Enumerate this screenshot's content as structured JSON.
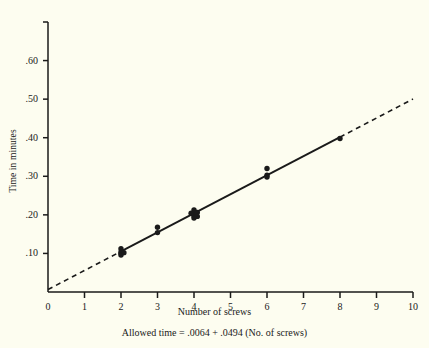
{
  "figure": {
    "background_color": "#fdfdf0",
    "ink_color": "#1a1a1a"
  },
  "axes": {
    "y_title": "Time in minutes",
    "x_title": "Number of screws",
    "y_tick_labels": [
      ".10",
      ".20",
      ".30",
      ".40",
      ".50",
      ".60"
    ],
    "x_tick_labels": [
      "0",
      "1",
      "2",
      "3",
      "4",
      "5",
      "6",
      "7",
      "8",
      "9",
      "10"
    ]
  },
  "caption": {
    "equation": "Allowed time = .0064 + .0494 (No. of screws)"
  },
  "chart_data": {
    "type": "scatter",
    "title": "",
    "subtitle": "",
    "xlabel": "Number of screws",
    "ylabel": "Time in minutes",
    "xlim": [
      0,
      10
    ],
    "ylim": [
      0,
      0.7
    ],
    "grid": false,
    "legend": "none",
    "x_ticks": [
      0,
      1,
      2,
      3,
      4,
      5,
      6,
      7,
      8,
      9,
      10
    ],
    "x_tick_labels": [
      "0",
      "1",
      "2",
      "3",
      "4",
      "5",
      "6",
      "7",
      "8",
      "9",
      "10"
    ],
    "y_ticks": [
      0.1,
      0.2,
      0.3,
      0.4,
      0.5,
      0.6,
      0.7
    ],
    "y_tick_labels": [
      ".10",
      ".20",
      ".30",
      ".40",
      ".50",
      ".60",
      ""
    ],
    "annotations": [
      "Allowed time = .0064 + .0494 (No. of screws)"
    ],
    "series": [
      {
        "name": "Observed times",
        "type": "scatter",
        "marker": "filled-circle",
        "color": "#1a1a1a",
        "points": [
          {
            "x": 2,
            "y": 0.112
          },
          {
            "x": 2,
            "y": 0.104
          },
          {
            "x": 2,
            "y": 0.1
          },
          {
            "x": 2,
            "y": 0.096
          },
          {
            "x": 2.08,
            "y": 0.102
          },
          {
            "x": 3,
            "y": 0.168
          },
          {
            "x": 3,
            "y": 0.154
          },
          {
            "x": 4,
            "y": 0.213
          },
          {
            "x": 4,
            "y": 0.206
          },
          {
            "x": 4,
            "y": 0.202
          },
          {
            "x": 4,
            "y": 0.197
          },
          {
            "x": 4,
            "y": 0.192
          },
          {
            "x": 3.92,
            "y": 0.204
          },
          {
            "x": 4.09,
            "y": 0.206
          },
          {
            "x": 4.09,
            "y": 0.196
          },
          {
            "x": 6,
            "y": 0.32
          },
          {
            "x": 6,
            "y": 0.303
          },
          {
            "x": 6,
            "y": 0.298
          },
          {
            "x": 8,
            "y": 0.398
          }
        ]
      },
      {
        "name": "Fitted regression line",
        "type": "line",
        "style": "solid",
        "color": "#1a1a1a",
        "intercept": 0.0064,
        "slope": 0.0494,
        "x_range": [
          2,
          8
        ]
      },
      {
        "name": "Extrapolated regression line",
        "type": "line",
        "style": "dashed",
        "color": "#1a1a1a",
        "intercept": 0.0064,
        "slope": 0.0494,
        "x_segments": [
          [
            0,
            2
          ],
          [
            8,
            10
          ]
        ]
      }
    ]
  }
}
